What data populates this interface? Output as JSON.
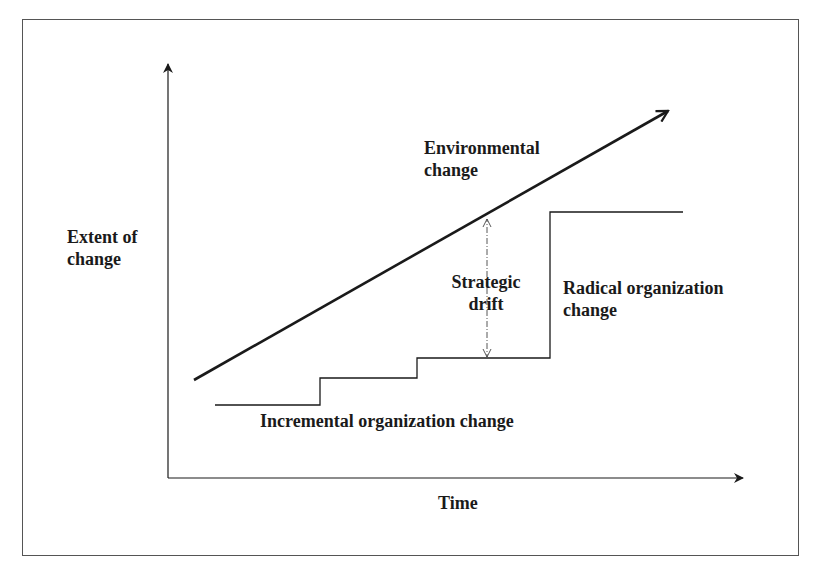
{
  "diagram": {
    "y_axis_label_line1": "Extent of",
    "y_axis_label_line2": "change",
    "x_axis_label": "Time",
    "environmental_label_line1": "Environmental",
    "environmental_label_line2": "change",
    "drift_label_line1": "Strategic",
    "drift_label_line2": "drift",
    "radical_label_line1": "Radical organization",
    "radical_label_line2": "change",
    "incremental_label": "Incremental organization change",
    "colors": {
      "line": "#1a1a1a",
      "frame": "#555555",
      "background": "#ffffff"
    }
  }
}
